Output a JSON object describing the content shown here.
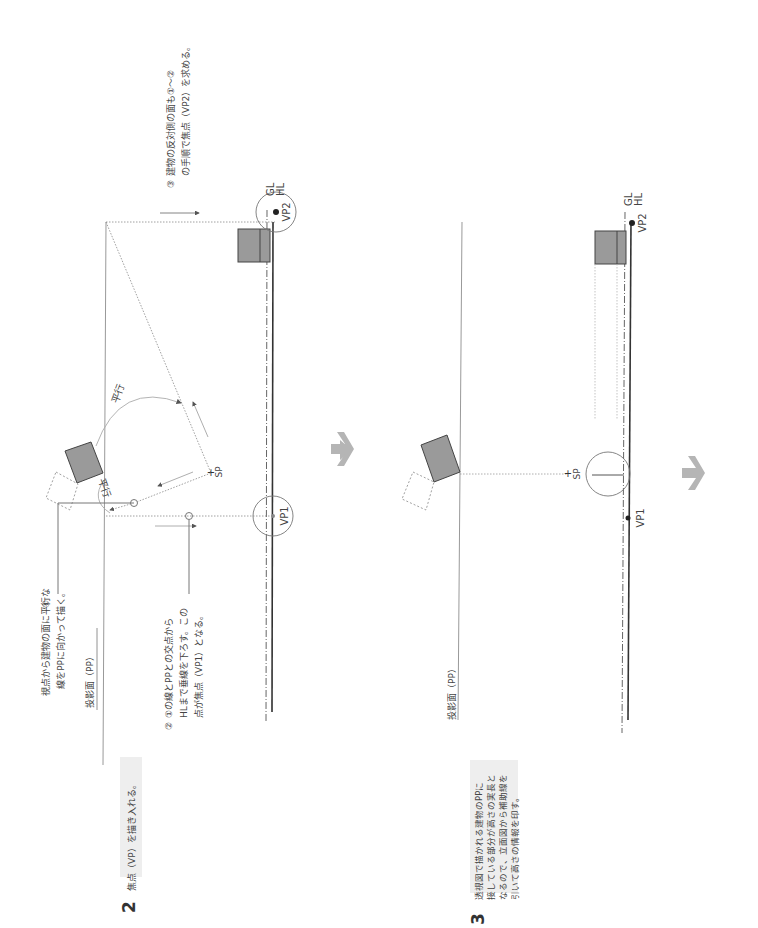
{
  "orientation": "rotated-90-clockwise",
  "colors": {
    "building_fill": "#9a9a9a",
    "building_stroke": "#444444",
    "line_dark": "#333333",
    "line_light": "#aaaaaa",
    "step_box_bg": "#eeeeee",
    "arrow": "#b5b5b5"
  },
  "step2": {
    "number": "2",
    "title": "焦点（VP）を描き入れる。",
    "notes": [
      {
        "marker": "①",
        "lines": [
          "視点から建物の面に平行な",
          "線をPPに向かって描く。"
        ]
      },
      {
        "marker": "②",
        "lines": [
          "①の線とPPとの交点から",
          "HLまで垂線を下ろす。この",
          "点が焦点（VP1）となる。"
        ]
      },
      {
        "marker": "③",
        "lines": [
          "建物の反対側の面も①〜②",
          "の手順で焦点（VP2）を求める。"
        ]
      }
    ],
    "pp_label": "投影面（PP）",
    "parallel_label_1": "平行",
    "parallel_label_2": "平行",
    "sp_label": "SP",
    "vp1_label": "VP1",
    "vp2_label": "VP2",
    "gl_label": "GL",
    "hl_label": "HL"
  },
  "step3": {
    "number": "3",
    "lines": [
      "透視図で描かれる建物のPPに",
      "接している部分が高さの実長と",
      "なるので、立面図から補助線を",
      "引いて高さの情報を印す。"
    ],
    "pp_label": "投影面（PP）",
    "sp_label": "SP",
    "vp1_label": "VP1",
    "vp2_label": "VP2",
    "gl_label": "GL",
    "hl_label": "HL"
  },
  "arrows": [
    "next-step-arrow-1",
    "next-step-arrow-2"
  ]
}
